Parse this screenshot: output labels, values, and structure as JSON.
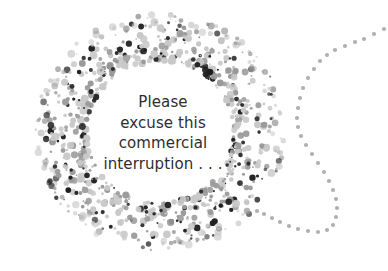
{
  "message": {
    "lines": [
      "Please",
      "excuse this",
      "commercial",
      "interruption . . ."
    ]
  },
  "decoration": {
    "ring_icon": "dotted-ring",
    "trail_icon": "dotted-trail",
    "colors": {
      "dark": "#1f1f1f",
      "mid": "#9a9a9a",
      "light": "#c8c8c8",
      "trail": "#b0b0b0"
    }
  }
}
